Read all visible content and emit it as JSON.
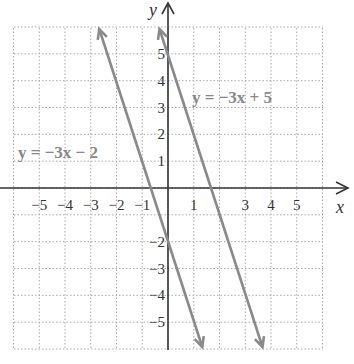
{
  "chart_data": {
    "type": "line",
    "title": "",
    "xlabel": "x",
    "ylabel": "y",
    "xlim": [
      -6,
      6
    ],
    "ylim": [
      -6,
      6
    ],
    "grid": true,
    "x_ticks": [
      "−5",
      "−4",
      "−3",
      "−2",
      "−1",
      "1",
      "3",
      "4",
      "5"
    ],
    "x_tick_values": [
      -5,
      -4,
      -3,
      -2,
      -1,
      1,
      3,
      4,
      5
    ],
    "y_ticks": [
      "5",
      "4",
      "3",
      "2",
      "1",
      "−2",
      "−3",
      "−4",
      "−5"
    ],
    "y_tick_values": [
      5,
      4,
      3,
      2,
      1,
      -2,
      -3,
      -4,
      -5
    ],
    "series": [
      {
        "name": "y = −3x − 2",
        "slope": -3,
        "intercept": -2,
        "x": [
          -2.67,
          1.33
        ],
        "y": [
          6,
          -6
        ],
        "color": "#8a8a8a"
      },
      {
        "name": "y = −3x + 5",
        "slope": -3,
        "intercept": 5,
        "x": [
          -0.33,
          3.67
        ],
        "y": [
          6,
          -6
        ],
        "color": "#8a8a8a"
      }
    ],
    "annotations": [
      {
        "text": "y = −3x − 2",
        "near": [
          -5.8,
          1.3
        ]
      },
      {
        "text": "y = −3x + 5",
        "near": [
          1.2,
          4.6
        ]
      }
    ]
  },
  "labels": {
    "x_axis": "x",
    "y_axis": "y",
    "line1": "y = −3x − 2",
    "line2": "y = −3x + 5"
  }
}
